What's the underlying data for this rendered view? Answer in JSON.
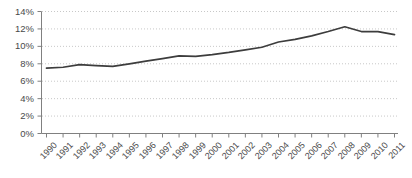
{
  "chart_data": {
    "type": "line",
    "title": "",
    "xlabel": "",
    "ylabel": "",
    "ylim": [
      0,
      14
    ],
    "grid": true,
    "legend": false,
    "legend_position": "none",
    "line_color": "#3d3d3d",
    "gridline_color": "#c8c8c8",
    "axis_color": "#808080",
    "tick_label_color": "#4a4a4a",
    "categories": [
      "1990",
      "1991",
      "1992",
      "1993",
      "1994",
      "1995",
      "1996",
      "1997",
      "1998",
      "1999",
      "2000",
      "2001",
      "2002",
      "2003",
      "2004",
      "2005",
      "2006",
      "2007",
      "2008",
      "2009",
      "2010",
      "2011"
    ],
    "values": [
      7.5,
      7.6,
      7.9,
      7.8,
      7.7,
      8.0,
      8.3,
      8.6,
      8.9,
      8.85,
      9.05,
      9.3,
      9.6,
      9.9,
      10.5,
      10.8,
      11.2,
      11.7,
      12.25,
      11.7,
      11.7,
      11.35
    ],
    "ytick_labels": [
      "0%",
      "2%",
      "4%",
      "6%",
      "8%",
      "10%",
      "12%",
      "14%"
    ],
    "ytick_values": [
      0,
      2,
      4,
      6,
      8,
      10,
      12,
      14
    ]
  }
}
